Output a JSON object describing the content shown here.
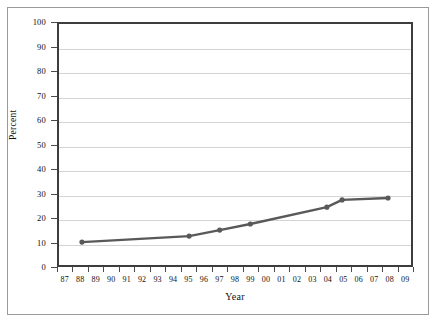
{
  "chart_data": {
    "type": "line",
    "title": "",
    "xlabel": "Year",
    "ylabel": "Percent",
    "ylim": [
      0,
      100
    ],
    "yticks": [
      0,
      10,
      20,
      30,
      40,
      50,
      60,
      70,
      80,
      90,
      100
    ],
    "grid": "horizontal",
    "legend": "none",
    "categories": [
      "87",
      "88",
      "89",
      "90",
      "91",
      "92",
      "93",
      "94",
      "95",
      "96",
      "97",
      "98",
      "99",
      "00",
      "01",
      "02",
      "03",
      "04",
      "05",
      "06",
      "07",
      "08",
      "09"
    ],
    "series": [
      {
        "name": "Percent",
        "color": "#595959",
        "marker": "circle",
        "points": [
          {
            "x": "88",
            "y": 9.5
          },
          {
            "x": "95",
            "y": 12.0
          },
          {
            "x": "97",
            "y": 14.5
          },
          {
            "x": "99",
            "y": 17.0
          },
          {
            "x": "04",
            "y": 24.0
          },
          {
            "x": "05",
            "y": 27.0
          },
          {
            "x": "08",
            "y": 27.8
          }
        ]
      }
    ]
  },
  "axes": {
    "y_title": "Percent",
    "x_title": "Year",
    "y_tick_labels": [
      "100",
      "90",
      "80",
      "70",
      "60",
      "50",
      "40",
      "30",
      "20",
      "10",
      "0"
    ],
    "x_tick_labels": [
      "87",
      "88",
      "89",
      "90",
      "91",
      "92",
      "93",
      "94",
      "95",
      "96",
      "97",
      "98",
      "99",
      "00",
      "01",
      "02",
      "03",
      "04",
      "05",
      "06",
      "07",
      "08",
      "09"
    ]
  },
  "colors": {
    "series_line": "#595959",
    "gridline": "#d4d4d4",
    "plot_border": "#3d3d3d",
    "outer_frame": "#9a9a9a",
    "text": "#111111",
    "background": "#ffffff"
  }
}
